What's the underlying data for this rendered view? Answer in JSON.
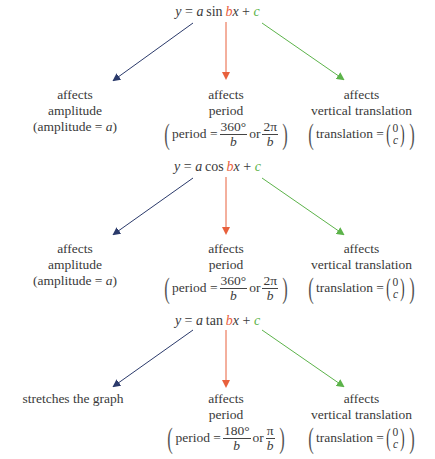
{
  "colors": {
    "amplitude_arrow": "#2b3a6b",
    "period_arrow": "#e8603c",
    "translation_arrow": "#5cb34a",
    "text": "#3a3a3a"
  },
  "blocks": [
    {
      "formula": {
        "y": "y",
        "eq": " = ",
        "a": "a",
        "func": "sin",
        "b": "b",
        "x": "x",
        "plus": " + ",
        "c": "c"
      },
      "left": {
        "line1": "affects",
        "line2": "amplitude",
        "line3_pre": "(amplitude = ",
        "line3_var": "a",
        "line3_post": ")"
      },
      "middle": {
        "line1": "affects",
        "line2": "period",
        "pre": "period = ",
        "num1": "360°",
        "den1": "b",
        "or": " or ",
        "num2": "2π",
        "den2": "b"
      },
      "right": {
        "line1": "affects",
        "line2": "vertical translation",
        "pre": "translation = ",
        "top": "0",
        "bottom": "c"
      }
    },
    {
      "formula": {
        "y": "y",
        "eq": " = ",
        "a": "a",
        "func": "cos",
        "b": "b",
        "x": "x",
        "plus": " + ",
        "c": "c"
      },
      "left": {
        "line1": "affects",
        "line2": "amplitude",
        "line3_pre": "(amplitude = ",
        "line3_var": "a",
        "line3_post": ")"
      },
      "middle": {
        "line1": "affects",
        "line2": "period",
        "pre": "period = ",
        "num1": "360°",
        "den1": "b",
        "or": " or ",
        "num2": "2π",
        "den2": "b"
      },
      "right": {
        "line1": "affects",
        "line2": "vertical translation",
        "pre": "translation = ",
        "top": "0",
        "bottom": "c"
      }
    },
    {
      "formula": {
        "y": "y",
        "eq": " = ",
        "a": "a",
        "func": "tan",
        "b": "b",
        "x": "x",
        "plus": " + ",
        "c": "c"
      },
      "left": {
        "line1": "stretches the graph"
      },
      "middle": {
        "line1": "affects",
        "line2": "period",
        "pre": "period = ",
        "num1": "180°",
        "den1": "b",
        "or": " or ",
        "num2": "π",
        "den2": "b"
      },
      "right": {
        "line1": "affects",
        "line2": "vertical translation",
        "pre": "translation = ",
        "top": "0",
        "bottom": "c"
      }
    }
  ]
}
